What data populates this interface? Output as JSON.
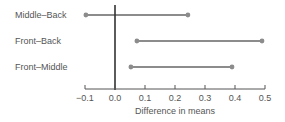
{
  "chart_data": {
    "type": "interval",
    "title": "",
    "xlabel": "Difference in means",
    "ylabel": "",
    "xlim": [
      -0.1,
      0.5
    ],
    "xticks": [
      -0.1,
      0.0,
      0.1,
      0.2,
      0.3,
      0.4,
      0.5
    ],
    "xtick_labels": [
      "−0.1",
      "0.0",
      "0.1",
      "0.2",
      "0.3",
      "0.4",
      "0.5"
    ],
    "reference_line": 0.0,
    "grid": false,
    "legend": null,
    "categories": [
      "Middle–Back",
      "Front–Back",
      "Front–Middle"
    ],
    "intervals": [
      {
        "label": "Middle–Back",
        "lower": -0.097,
        "upper": 0.243
      },
      {
        "label": "Front–Back",
        "lower": 0.073,
        "upper": 0.49
      },
      {
        "label": "Front–Middle",
        "lower": 0.053,
        "upper": 0.39
      }
    ],
    "colors": {
      "interval": "#8c8c8c",
      "reference": "#333333",
      "axis": "#555555",
      "text": "#555555"
    }
  }
}
